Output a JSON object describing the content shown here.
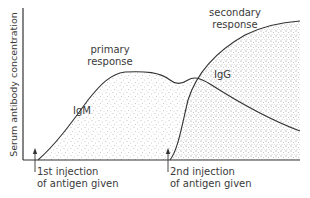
{
  "diagram": {
    "y_axis_label": "Serum antibody concentration",
    "annotations": {
      "primary_line1": "primary",
      "primary_line2": "response",
      "secondary_line1": "secondary",
      "secondary_line2": "response",
      "igm": "IgM",
      "igg": "IgG",
      "first_injection_line1": "1st injection",
      "first_injection_line2": "of antigen given",
      "second_injection_line1": "2nd injection",
      "second_injection_line2": "of antigen given"
    },
    "colors": {
      "line": "#333333",
      "stipple": "#8a8a8a",
      "background": "#ffffff"
    },
    "curves": [
      {
        "name": "IgM",
        "description": "primary response curve, rises after 1st injection, plateaus, small bump then declines"
      },
      {
        "name": "IgG",
        "description": "secondary response curve, rises steeply after 2nd injection to a higher plateau"
      }
    ]
  }
}
